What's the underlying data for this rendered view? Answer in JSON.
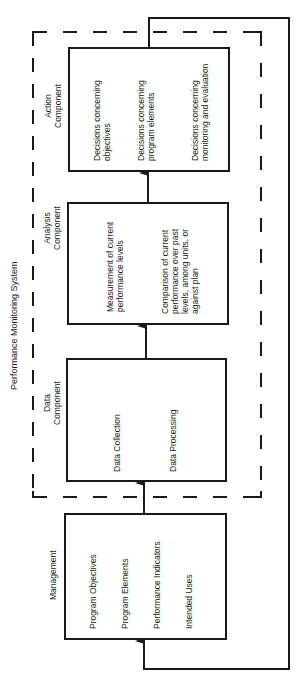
{
  "diagram": {
    "system_title": "Performance Monitoring System",
    "components": [
      {
        "id": "management",
        "label": "Management",
        "items": [
          "Program Objectives",
          "Program Elements",
          "Performance Indicators",
          "Intended Uses"
        ]
      },
      {
        "id": "data",
        "label_line1": "Data",
        "label_line2": "Component",
        "items": [
          "Data Collection",
          "Data Processing"
        ]
      },
      {
        "id": "analysis",
        "label_line1": "Analysis",
        "label_line2": "Component",
        "items": [
          {
            "line1": "Measurement of current",
            "line2": "performance levels"
          },
          {
            "line1": "Comparison of current",
            "line2": "performance over past",
            "line3": "levels, among units, or",
            "line4": "against plan"
          }
        ]
      },
      {
        "id": "action",
        "label_line1": "Action",
        "label_line2": "Component",
        "items": [
          {
            "line1": "Decisions concerning",
            "line2": "objectives"
          },
          {
            "line1": "Decisions concerning",
            "line2": "program elements"
          },
          {
            "line1": "Decisions concerning",
            "line2": "monitoring and evaluation"
          }
        ]
      }
    ],
    "flow": [
      "Management",
      "Data Component",
      "Analysis Component",
      "Action Component",
      "Management (feedback)"
    ],
    "colors": {
      "line": "#1a1a1a",
      "background": "#ffffff"
    }
  }
}
